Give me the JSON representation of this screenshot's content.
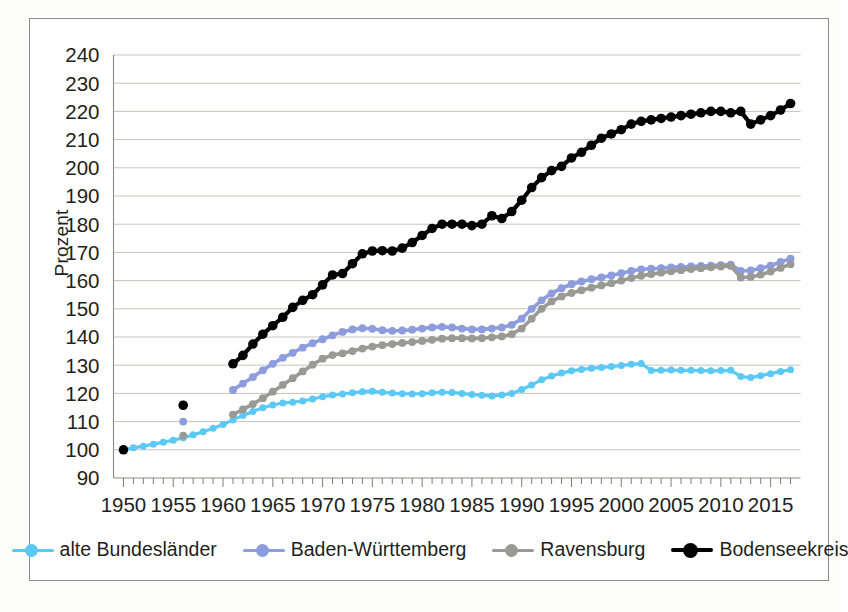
{
  "chart_data": {
    "type": "line",
    "title": "",
    "subtitle": "",
    "xlabel": "",
    "ylabel": "Prozent",
    "xlim": [
      1949,
      2018
    ],
    "ylim": [
      90,
      240
    ],
    "yticks": [
      90,
      100,
      110,
      120,
      130,
      140,
      150,
      160,
      170,
      180,
      190,
      200,
      210,
      220,
      230,
      240
    ],
    "xticks": [
      1950,
      1955,
      1960,
      1965,
      1970,
      1975,
      1980,
      1985,
      1990,
      1995,
      2000,
      2005,
      2010,
      2015
    ],
    "xtick_labels": [
      "1950",
      "1955",
      "1960",
      "1965",
      "1970",
      "1975",
      "1980",
      "1985",
      "1990",
      "1995",
      "2000",
      "2005",
      "2010",
      "2015"
    ],
    "minor_xtick_interval": 1,
    "grid": "horizontal",
    "legend_position": "bottom",
    "marker": "circle",
    "series": [
      {
        "name": "alte Bundesländer",
        "color": "#5CC9F5",
        "line_width": 3.2,
        "marker_size": 7.0,
        "x": [
          1950,
          1951,
          1952,
          1953,
          1954,
          1955,
          1956,
          1957,
          1958,
          1959,
          1960,
          1961,
          1962,
          1963,
          1964,
          1965,
          1966,
          1967,
          1968,
          1969,
          1970,
          1971,
          1972,
          1973,
          1974,
          1975,
          1976,
          1977,
          1978,
          1979,
          1980,
          1981,
          1982,
          1983,
          1984,
          1985,
          1986,
          1987,
          1988,
          1989,
          1990,
          1991,
          1992,
          1993,
          1994,
          1995,
          1996,
          1997,
          1998,
          1999,
          2000,
          2001,
          2002,
          2003,
          2004,
          2005,
          2006,
          2007,
          2008,
          2009,
          2010,
          2011,
          2012,
          2013,
          2014,
          2015,
          2016,
          2017
        ],
        "y": [
          100.0,
          100.7,
          101.3,
          102.0,
          102.7,
          103.4,
          104.3,
          105.3,
          106.4,
          107.6,
          109.0,
          110.6,
          112.2,
          113.6,
          114.9,
          115.9,
          116.6,
          116.9,
          117.3,
          118.0,
          118.8,
          119.4,
          119.8,
          120.2,
          120.6,
          120.8,
          120.4,
          120.1,
          119.9,
          119.8,
          119.9,
          120.2,
          120.4,
          120.3,
          120.0,
          119.6,
          119.3,
          119.1,
          119.4,
          120.0,
          121.4,
          123.0,
          124.8,
          126.2,
          127.2,
          128.0,
          128.5,
          128.9,
          129.2,
          129.5,
          129.9,
          130.3,
          130.6,
          128.1,
          128.2,
          128.3,
          128.2,
          128.2,
          128.1,
          128.0,
          128.1,
          128.2,
          126.0,
          125.6,
          126.3,
          127.0,
          127.8,
          128.4
        ]
      },
      {
        "name": "Baden-Württemberg",
        "color": "#8C9CDC",
        "line_width": 3.6,
        "marker_size": 7.8,
        "x": [
          1950,
          1956,
          1961,
          1962,
          1963,
          1964,
          1965,
          1966,
          1967,
          1968,
          1969,
          1970,
          1971,
          1972,
          1973,
          1974,
          1975,
          1976,
          1977,
          1978,
          1979,
          1980,
          1981,
          1982,
          1983,
          1984,
          1985,
          1986,
          1987,
          1988,
          1989,
          1990,
          1991,
          1992,
          1993,
          1994,
          1995,
          1996,
          1997,
          1998,
          1999,
          2000,
          2001,
          2002,
          2003,
          2004,
          2005,
          2006,
          2007,
          2008,
          2009,
          2010,
          2011,
          2012,
          2013,
          2014,
          2015,
          2016,
          2017
        ],
        "y": [
          100.0,
          110.0,
          121.2,
          123.5,
          125.8,
          128.2,
          130.5,
          132.6,
          134.4,
          136.2,
          137.8,
          139.2,
          140.6,
          141.8,
          142.7,
          143.1,
          142.9,
          142.4,
          142.2,
          142.3,
          142.6,
          143.0,
          143.4,
          143.6,
          143.4,
          143.0,
          142.7,
          142.7,
          143.0,
          143.4,
          144.3,
          146.5,
          150.0,
          153.0,
          155.5,
          157.3,
          158.7,
          159.7,
          160.5,
          161.1,
          161.8,
          162.6,
          163.4,
          164.0,
          164.2,
          164.4,
          164.7,
          164.9,
          165.0,
          165.2,
          165.3,
          165.5,
          165.7,
          163.4,
          163.6,
          164.4,
          165.3,
          166.6,
          167.8
        ]
      },
      {
        "name": "Ravensburg",
        "color": "#9A9A94",
        "line_width": 3.6,
        "marker_size": 7.8,
        "x": [
          1950,
          1956,
          1961,
          1962,
          1963,
          1964,
          1965,
          1966,
          1967,
          1968,
          1969,
          1970,
          1971,
          1972,
          1973,
          1974,
          1975,
          1976,
          1977,
          1978,
          1979,
          1980,
          1981,
          1982,
          1983,
          1984,
          1985,
          1986,
          1987,
          1988,
          1989,
          1990,
          1991,
          1992,
          1993,
          1994,
          1995,
          1996,
          1997,
          1998,
          1999,
          2000,
          2001,
          2002,
          2003,
          2004,
          2005,
          2006,
          2007,
          2008,
          2009,
          2010,
          2011,
          2012,
          2013,
          2014,
          2015,
          2016,
          2017
        ],
        "y": [
          100.0,
          105.0,
          112.5,
          114.3,
          116.2,
          118.3,
          120.6,
          123.0,
          125.4,
          127.8,
          130.2,
          132.3,
          133.6,
          134.2,
          135.0,
          135.9,
          136.6,
          137.1,
          137.5,
          137.9,
          138.2,
          138.6,
          139.0,
          139.4,
          139.6,
          139.6,
          139.5,
          139.6,
          139.9,
          140.2,
          141.0,
          143.0,
          146.5,
          150.0,
          152.6,
          154.4,
          155.6,
          156.6,
          157.5,
          158.3,
          159.1,
          160.0,
          160.9,
          161.7,
          162.3,
          162.8,
          163.3,
          163.7,
          164.1,
          164.4,
          164.7,
          165.0,
          165.2,
          161.1,
          161.3,
          162.1,
          163.2,
          164.5,
          165.8
        ]
      },
      {
        "name": "Bodenseekreis",
        "color": "#000000",
        "line_width": 4.2,
        "marker_size": 9.6,
        "x": [
          1950,
          1956,
          1961,
          1962,
          1963,
          1964,
          1965,
          1966,
          1967,
          1968,
          1969,
          1970,
          1971,
          1972,
          1973,
          1974,
          1975,
          1976,
          1977,
          1978,
          1979,
          1980,
          1981,
          1982,
          1983,
          1984,
          1985,
          1986,
          1987,
          1988,
          1989,
          1990,
          1991,
          1992,
          1993,
          1994,
          1995,
          1996,
          1997,
          1998,
          1999,
          2000,
          2001,
          2002,
          2003,
          2004,
          2005,
          2006,
          2007,
          2008,
          2009,
          2010,
          2011,
          2012,
          2013,
          2014,
          2015,
          2016,
          2017
        ],
        "y": [
          100.0,
          115.8,
          130.5,
          133.5,
          137.5,
          141.0,
          144.0,
          147.0,
          150.5,
          153.0,
          155.0,
          158.5,
          162.0,
          162.5,
          166.0,
          169.5,
          170.5,
          170.6,
          170.5,
          171.5,
          173.5,
          176.0,
          178.5,
          180.0,
          180.0,
          180.0,
          179.5,
          180.0,
          183.0,
          182.0,
          184.5,
          188.5,
          193.0,
          196.5,
          199.0,
          200.5,
          203.5,
          205.5,
          208.0,
          210.5,
          212.0,
          213.5,
          215.5,
          216.5,
          217.0,
          217.5,
          218.0,
          218.5,
          219.0,
          219.5,
          220.0,
          220.0,
          219.5,
          220.0,
          215.5,
          217.0,
          218.5,
          220.5,
          222.8
        ]
      }
    ]
  },
  "legend": {
    "items": [
      {
        "label": "alte Bundesländer",
        "color": "#5CC9F5",
        "icon": "line-marker-icon"
      },
      {
        "label": "Baden-Württemberg",
        "color": "#8C9CDC",
        "icon": "line-marker-icon"
      },
      {
        "label": "Ravensburg",
        "color": "#9A9A94",
        "icon": "line-marker-icon"
      },
      {
        "label": "Bodenseekreis",
        "color": "#000000",
        "icon": "line-marker-icon"
      }
    ]
  }
}
